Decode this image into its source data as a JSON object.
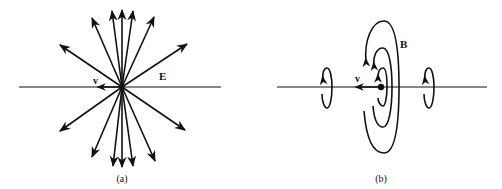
{
  "figure": {
    "panel_a": {
      "caption": "(a)",
      "field_label": "E",
      "velocity_label": "v",
      "description": "Electric field lines radiating from a moving point charge, compressed perpendicular to velocity"
    },
    "panel_b": {
      "caption": "(b)",
      "field_label": "B",
      "velocity_label": "v",
      "description": "Magnetic field lines circling the direction of motion of the charge"
    },
    "colors": {
      "ink": "#111111",
      "background": "#ffffff"
    }
  }
}
